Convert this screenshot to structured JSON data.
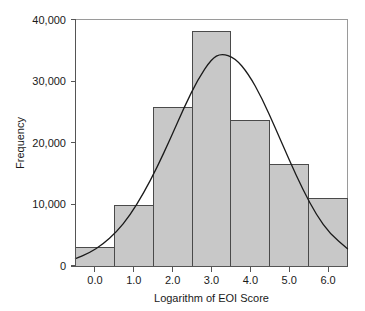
{
  "chart_data": {
    "type": "bar",
    "title": "",
    "subtitle": "",
    "xlabel": "Logarithm of EOI Score",
    "ylabel": "Frequency",
    "categories": [
      "0.0",
      "1.0",
      "2.0",
      "3.0",
      "4.0",
      "5.0",
      "6.0"
    ],
    "bin_edges": [
      -0.5,
      0.5,
      1.5,
      2.5,
      3.5,
      4.5,
      5.5,
      6.5
    ],
    "bin_centers": [
      0.0,
      1.0,
      2.0,
      3.0,
      4.0,
      5.0,
      6.0
    ],
    "values": [
      3000,
      9800,
      25700,
      38000,
      23600,
      16500,
      10900
    ],
    "bar_fill_color": "#c8c8c8",
    "bar_edge_color": "#4a4a4a",
    "xlim": [
      -0.5,
      6.5
    ],
    "ylim": [
      0,
      40000
    ],
    "xticks": [
      0.0,
      1.0,
      2.0,
      3.0,
      4.0,
      5.0,
      6.0
    ],
    "xtick_labels": [
      "0.0",
      "1.0",
      "2.0",
      "3.0",
      "4.0",
      "5.0",
      "6.0"
    ],
    "yticks": [
      0,
      10000,
      20000,
      30000,
      40000
    ],
    "ytick_labels": [
      "0",
      "10,000",
      "20,000",
      "30,000",
      "40,000"
    ],
    "grid": false,
    "legend": null,
    "legend_position": "none",
    "overlay": {
      "name": "normal-distribution-curve",
      "type": "line",
      "color": "#1a1a1a",
      "peak_x": 3.25,
      "peak_y": 34500,
      "mean": 3.25,
      "std_dev": 1.45,
      "amplitude": 34500,
      "x": [
        -0.5,
        -0.15,
        0.2,
        0.55,
        0.9,
        1.25,
        1.6,
        1.95,
        2.3,
        2.65,
        3.0,
        3.25,
        3.6,
        3.95,
        4.3,
        4.65,
        5.0,
        5.35,
        5.7,
        6.05,
        6.5
      ],
      "y": [
        1200,
        2100,
        3500,
        5500,
        8200,
        11800,
        16000,
        20800,
        25800,
        30300,
        33600,
        34500,
        33800,
        31200,
        27200,
        22300,
        17200,
        12400,
        8300,
        5200,
        2800
      ]
    }
  },
  "axes": {
    "x_title": "Logarithm of EOI Score",
    "y_title": "Frequency"
  }
}
